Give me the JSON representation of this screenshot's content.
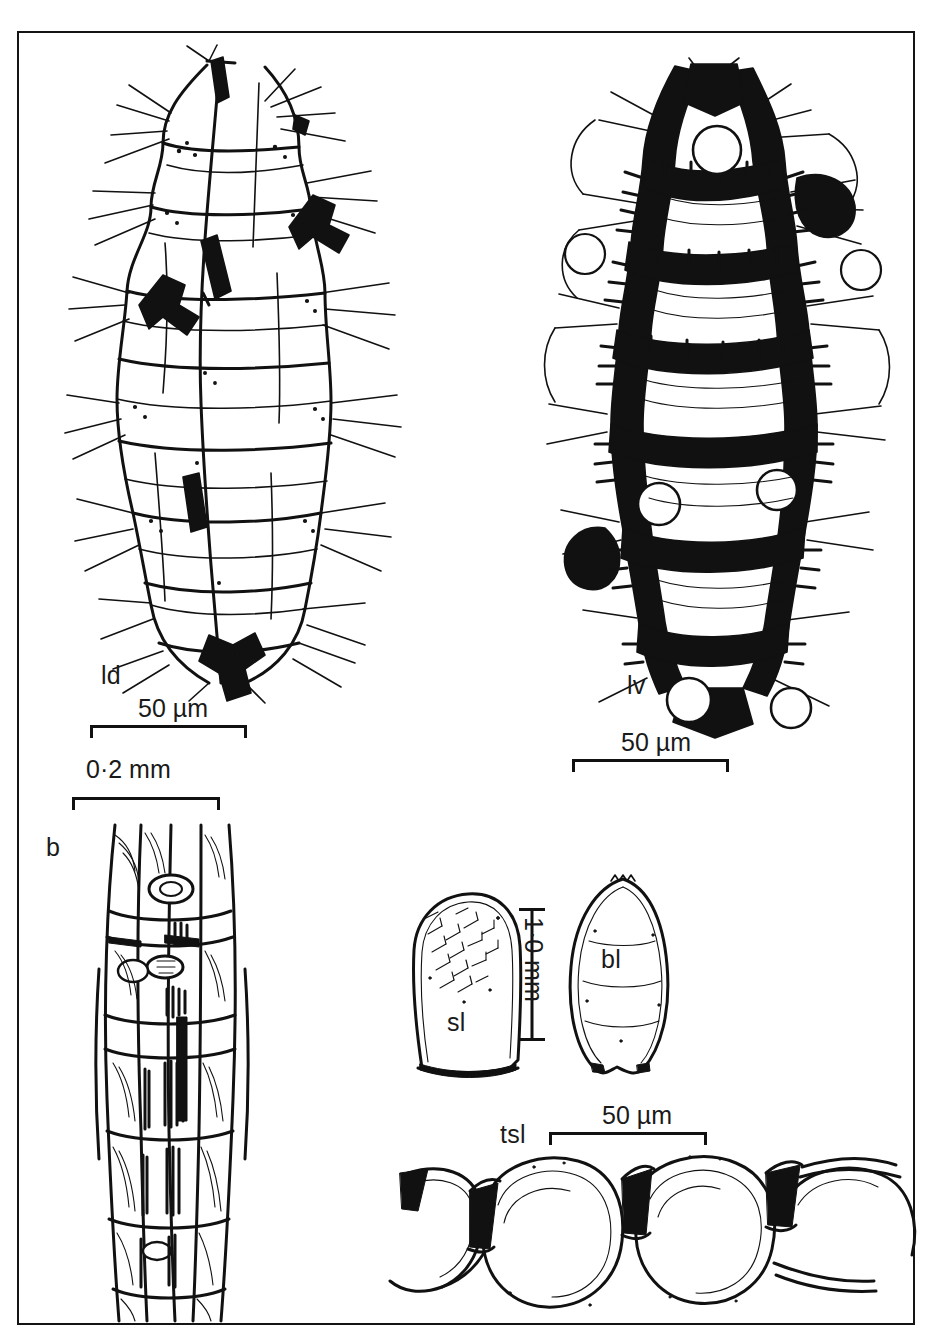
{
  "figure": {
    "kind": "botanical-plate",
    "background": "#ffffff",
    "ink_color": "#111111",
    "frame": {
      "border_color": "#141414",
      "border_width_px": 2
    }
  },
  "panels": [
    {
      "id": "ld",
      "label": "ld",
      "meaning": "leaf surface, dorsal (abaxial) view",
      "scale": {
        "text": "50 µm",
        "value": 50,
        "unit": "µm",
        "orientation": "horizontal"
      }
    },
    {
      "id": "lv",
      "label": "lv",
      "meaning": "leaf surface, ventral (adaxial) view",
      "scale": {
        "text": "50 µm",
        "value": 50,
        "unit": "µm",
        "orientation": "horizontal"
      }
    },
    {
      "id": "b",
      "label": "b",
      "meaning": "branch, longitudinal surface view",
      "scale": {
        "text": "0·2 mm",
        "value": 0.2,
        "unit": "mm",
        "orientation": "horizontal"
      }
    },
    {
      "id": "sl",
      "label": "sl",
      "meaning": "stem leaf",
      "scale": {
        "text": "1·0 mm",
        "value": 1.0,
        "unit": "mm",
        "orientation": "vertical"
      }
    },
    {
      "id": "bl",
      "label": "bl",
      "meaning": "branch leaf",
      "scale": {
        "text": "1·0 mm",
        "value": 1.0,
        "unit": "mm",
        "orientation": "vertical"
      }
    },
    {
      "id": "tsl",
      "label": "tsl",
      "meaning": "transverse section of leaf",
      "scale": {
        "text": "50 µm",
        "value": 50,
        "unit": "µm",
        "orientation": "horizontal"
      }
    }
  ],
  "labels": {
    "ld": "ld",
    "lv": "lv",
    "b": "b",
    "sl": "sl",
    "bl": "bl",
    "tsl": "tsl"
  },
  "scales": {
    "ld_bar": "50  µm",
    "lv_bar": "50  µm",
    "b_bar": "0·2  mm",
    "leaf_bar": "1·0 mm",
    "tsl_bar": "50  µm"
  }
}
